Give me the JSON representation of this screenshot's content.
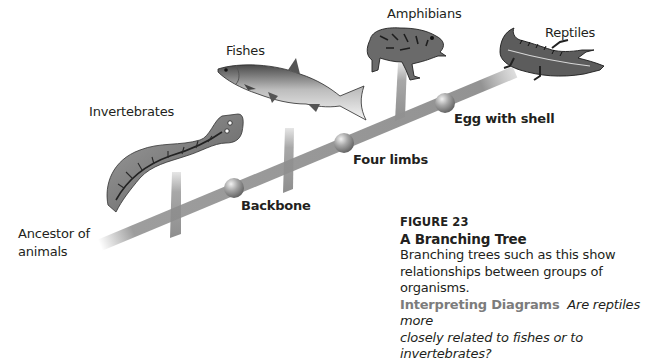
{
  "diagram": {
    "type": "branching-tree",
    "root_label": "Ancestor of\nanimals",
    "root_label_lines": [
      "Ancestor of",
      "animals"
    ],
    "groups": [
      {
        "id": "invertebrates",
        "label": "Invertebrates",
        "icon": "flatworm-icon"
      },
      {
        "id": "fishes",
        "label": "Fishes",
        "icon": "fish-icon"
      },
      {
        "id": "amphibians",
        "label": "Amphibians",
        "icon": "frog-icon"
      },
      {
        "id": "reptiles",
        "label": "Reptiles",
        "icon": "alligator-icon"
      }
    ],
    "nodes": [
      {
        "id": "backbone",
        "label": "Backbone"
      },
      {
        "id": "four-limbs",
        "label": "Four limbs"
      },
      {
        "id": "egg-with-shell",
        "label": "Egg with shell"
      }
    ],
    "colors": {
      "trunk": "#8c8c8c",
      "node": "#9a9a9a",
      "text": "#231f20",
      "interpreting": "#7c7c7c"
    }
  },
  "caption": {
    "figure_word": "Figure",
    "figure_number": "23",
    "figure_label": "FIGURE 23",
    "title": "A Branching Tree",
    "body": "Branching trees such as this show relationships between groups of organisms.",
    "body_lines": [
      "Branching trees such as this show",
      "relationships between groups of organisms."
    ],
    "skill_label": "Interpreting Diagrams",
    "question": "Are reptiles more closely related to fishes or to invertebrates?",
    "question_lines": [
      "Are reptiles more",
      "closely related to fishes or to invertebrates?"
    ]
  }
}
